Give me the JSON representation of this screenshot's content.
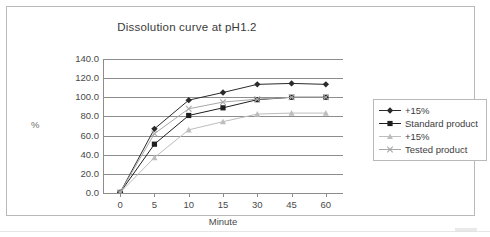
{
  "chart_data": {
    "type": "line",
    "title": "Dissolution curve at pH1.2",
    "xlabel": "Minute",
    "ylabel": "%",
    "categories": [
      "0",
      "5",
      "10",
      "15",
      "30",
      "45",
      "60"
    ],
    "ylim": [
      0,
      140
    ],
    "ytick_labels": [
      "0.0",
      "20.0",
      "40.0",
      "60.0",
      "80.0",
      "100.0",
      "120.0",
      "140.0"
    ],
    "ytick_values": [
      0,
      20,
      40,
      60,
      80,
      100,
      120,
      140
    ],
    "grid": true,
    "legend_position": "right",
    "series": [
      {
        "name": "+15%",
        "marker": "diamond",
        "color": "#2b2b2b",
        "values": [
          0.5,
          67.0,
          97.0,
          105.0,
          113.5,
          114.5,
          113.5
        ]
      },
      {
        "name": "Standard product",
        "marker": "square",
        "color": "#1f1f1f",
        "values": [
          0.5,
          51.0,
          81.0,
          89.0,
          97.5,
          100.0,
          100.0
        ]
      },
      {
        "name": "+15%",
        "marker": "triangle",
        "color": "#bdbdbd",
        "values": [
          0.5,
          37.0,
          66.0,
          74.5,
          82.5,
          83.5,
          83.5
        ]
      },
      {
        "name": "Tested product",
        "marker": "cross",
        "color": "#a8a8a8",
        "values": [
          0.5,
          62.0,
          88.0,
          95.0,
          98.0,
          100.0,
          100.0
        ]
      }
    ]
  },
  "legend": {
    "items": [
      {
        "label": "+15%"
      },
      {
        "label": "Standard product"
      },
      {
        "label": "+15%"
      },
      {
        "label": "Tested product"
      }
    ]
  }
}
